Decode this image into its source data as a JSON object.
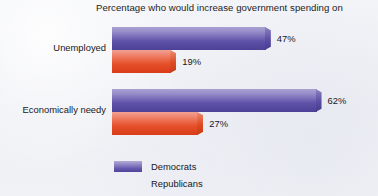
{
  "chart_data": {
    "type": "bar",
    "orientation": "horizontal",
    "title": "Percentage who would increase government spending on",
    "xlabel": "",
    "ylabel": "",
    "categories": [
      "Unemployed",
      "Economically needy"
    ],
    "series": [
      {
        "name": "Democrats",
        "color": "#5e51a8",
        "values": [
          47,
          62
        ],
        "labels": [
          "47%",
          "62%"
        ]
      },
      {
        "name": "Republicans",
        "color": "#e4502a",
        "values": [
          19,
          27
        ],
        "labels": [
          "19%",
          "27%"
        ]
      }
    ],
    "value_suffix": "%",
    "xlim": [
      0,
      100
    ],
    "grid": false,
    "legend_position": "bottom-left"
  },
  "legend": {
    "items": [
      {
        "label": "Democrats",
        "swatch": "dem"
      },
      {
        "label": "Republicans",
        "swatch": "rep"
      }
    ]
  }
}
